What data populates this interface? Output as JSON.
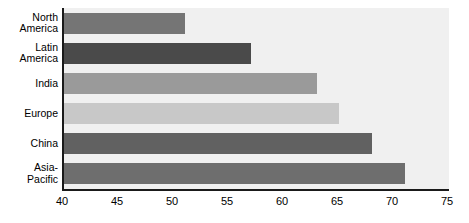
{
  "chart_data": {
    "type": "bar",
    "orientation": "horizontal",
    "title": "",
    "subtitle": "",
    "xlabel": "",
    "ylabel": "",
    "categories": [
      "North America",
      "Latin America",
      "India",
      "Europe",
      "China",
      "Asia-Pacific"
    ],
    "values": [
      51,
      57,
      63,
      65,
      68,
      71
    ],
    "series": [
      {
        "name": "",
        "values": [
          51,
          57,
          63,
          65,
          68,
          71
        ]
      }
    ],
    "bar_colors": [
      "#757575",
      "#4a4a4a",
      "#9a9a9a",
      "#c8c8c8",
      "#616161",
      "#6e6e6e"
    ],
    "xlim": [
      40,
      75
    ],
    "xticks": [
      40,
      45,
      50,
      55,
      60,
      65,
      70,
      75
    ],
    "xtick_labels": [
      "40",
      "45",
      "50",
      "55",
      "60",
      "65",
      "70",
      "75"
    ],
    "grid": false,
    "legend": false,
    "legend_position": "none",
    "plot_background": "#f0f0f0",
    "axis_color": "#1a1a1a",
    "annotations": []
  },
  "categories_display": [
    "North\nAmerica",
    "Latin\nAmerica",
    "India",
    "Europe",
    "China",
    "Asia-\nPacific"
  ]
}
